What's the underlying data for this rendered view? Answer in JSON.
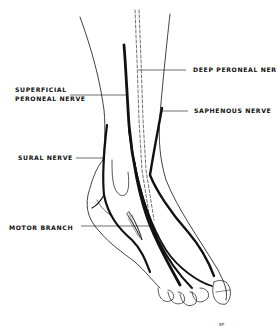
{
  "figure": {
    "labels": {
      "deep_peroneal": "DEEP PERONEAL NERVE",
      "superficial_peroneal_line1": "SUPERFICIAL",
      "superficial_peroneal_line2": "PERONEAL NERVE",
      "saphenous": "SAPHENOUS NERVE",
      "sural": "SURAL NERVE",
      "motor_branch": "MOTOR BRANCH"
    },
    "signature": "BP",
    "colors": {
      "background": "#ffffff",
      "ink": "#111111"
    }
  }
}
